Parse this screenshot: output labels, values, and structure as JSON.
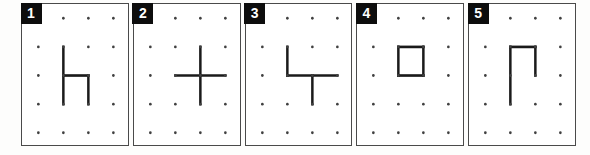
{
  "strip": {
    "description": "Five numbered dot-grid (geoboard) figure panels",
    "grid": {
      "cols": 4,
      "rows": 5
    },
    "style": {
      "line_color": "#1a1a1a",
      "dot_color": "#404040",
      "panel_border_color": "#4a4a4a",
      "panel_bg": "#ffffff",
      "badge_bg": "#0d0d0d",
      "badge_fg": "#ffffff",
      "page_bg": "#fdfdfc"
    },
    "panels": [
      {
        "label": "1",
        "shape": "h-shape",
        "segments": [
          [
            2,
            2,
            2,
            4
          ],
          [
            2,
            3,
            3,
            3
          ],
          [
            3,
            3,
            3,
            4
          ]
        ]
      },
      {
        "label": "2",
        "shape": "plus-cross",
        "segments": [
          [
            3,
            2,
            3,
            4
          ],
          [
            2,
            3,
            4,
            3
          ]
        ]
      },
      {
        "label": "3",
        "shape": "tee-with-corner",
        "segments": [
          [
            2,
            2,
            2,
            3
          ],
          [
            2,
            3,
            4,
            3
          ],
          [
            3,
            3,
            3,
            4
          ]
        ]
      },
      {
        "label": "4",
        "shape": "unit-square",
        "segments": [
          [
            2,
            2,
            3,
            2
          ],
          [
            3,
            2,
            3,
            3
          ],
          [
            2,
            3,
            3,
            3
          ],
          [
            2,
            2,
            2,
            3
          ]
        ]
      },
      {
        "label": "5",
        "shape": "open-gate",
        "segments": [
          [
            2,
            2,
            2,
            4
          ],
          [
            2,
            2,
            3,
            2
          ],
          [
            3,
            2,
            3,
            3
          ]
        ]
      }
    ]
  }
}
